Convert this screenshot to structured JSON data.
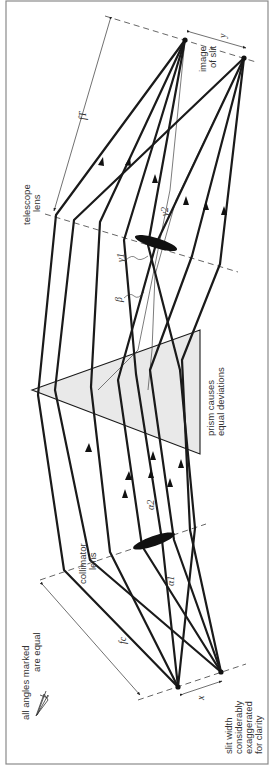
{
  "diagram": {
    "orientation": "rotated 90 degrees counter-clockwise",
    "labels": {
      "telescope_lens": [
        "telescope",
        "lens"
      ],
      "collimator_lens": [
        "collimator",
        "lens"
      ],
      "image_of_slit": [
        "image",
        "of slit"
      ],
      "prism_note": [
        "prism causes",
        "equal deviations"
      ],
      "slit_note": [
        "slit width",
        "considerably",
        "exaggerated",
        "for clarity"
      ],
      "angles_note_line1": "all angles marked",
      "angles_note_line2": "are equal",
      "f_telescope": "fT",
      "f_collimator": "fc",
      "x_label": "x",
      "y_label": "y",
      "alpha1": "α1",
      "alpha2": "α2",
      "beta": "β",
      "gamma1": "γ1",
      "gamma2": "γ2"
    },
    "colors": {
      "ray": "#1a1a1a",
      "prism_fill": "#e9e9e9",
      "frame": "#8a8a8a",
      "text": "#333333"
    }
  }
}
